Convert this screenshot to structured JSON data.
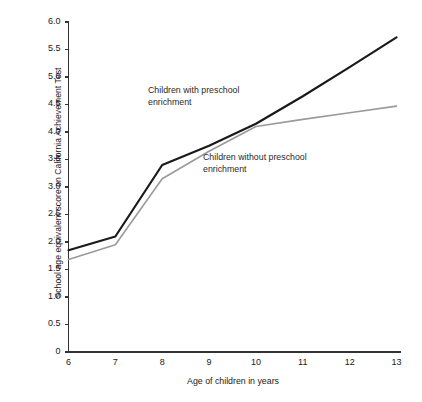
{
  "chart_data": {
    "type": "line",
    "title": "",
    "subtitle": "",
    "xlabel": "Age of children in years",
    "ylabel": "School age equivalent score on California Achievement Test",
    "x": [
      6,
      7,
      8,
      9,
      10,
      11,
      12,
      13
    ],
    "xlim": [
      6,
      13
    ],
    "ylim": [
      0,
      6.0
    ],
    "xticks": [
      "6",
      "7",
      "8",
      "9",
      "10",
      "11",
      "12",
      "13"
    ],
    "yticks": [
      "0",
      "0.5",
      "1.0",
      "1.5",
      "2.0",
      "2.5",
      "3.0",
      "3.5",
      "4.0",
      "4.5",
      "5.0",
      "5.5",
      "6.0"
    ],
    "ytick_values": [
      0,
      0.5,
      1.0,
      1.5,
      2.0,
      2.5,
      3.0,
      3.5,
      4.0,
      4.5,
      5.0,
      5.5,
      6.0
    ],
    "grid": false,
    "legend_position": "inline-annotations",
    "series": [
      {
        "name": "Children with preschool enrichment",
        "color": "#1a1a1a",
        "width": 2.2,
        "values": [
          1.85,
          2.1,
          3.4,
          3.75,
          4.15,
          4.65,
          5.18,
          5.72
        ]
      },
      {
        "name": "Children without preschool enrichment",
        "color": "#9a9a9a",
        "width": 1.6,
        "values": [
          1.68,
          1.95,
          3.15,
          3.65,
          4.1,
          4.23,
          4.35,
          4.47
        ]
      }
    ],
    "annotations": [
      {
        "text": "Children with preschool\nenrichment",
        "series": 0
      },
      {
        "text": "Children without preschool\nenrichment",
        "series": 1
      }
    ]
  }
}
